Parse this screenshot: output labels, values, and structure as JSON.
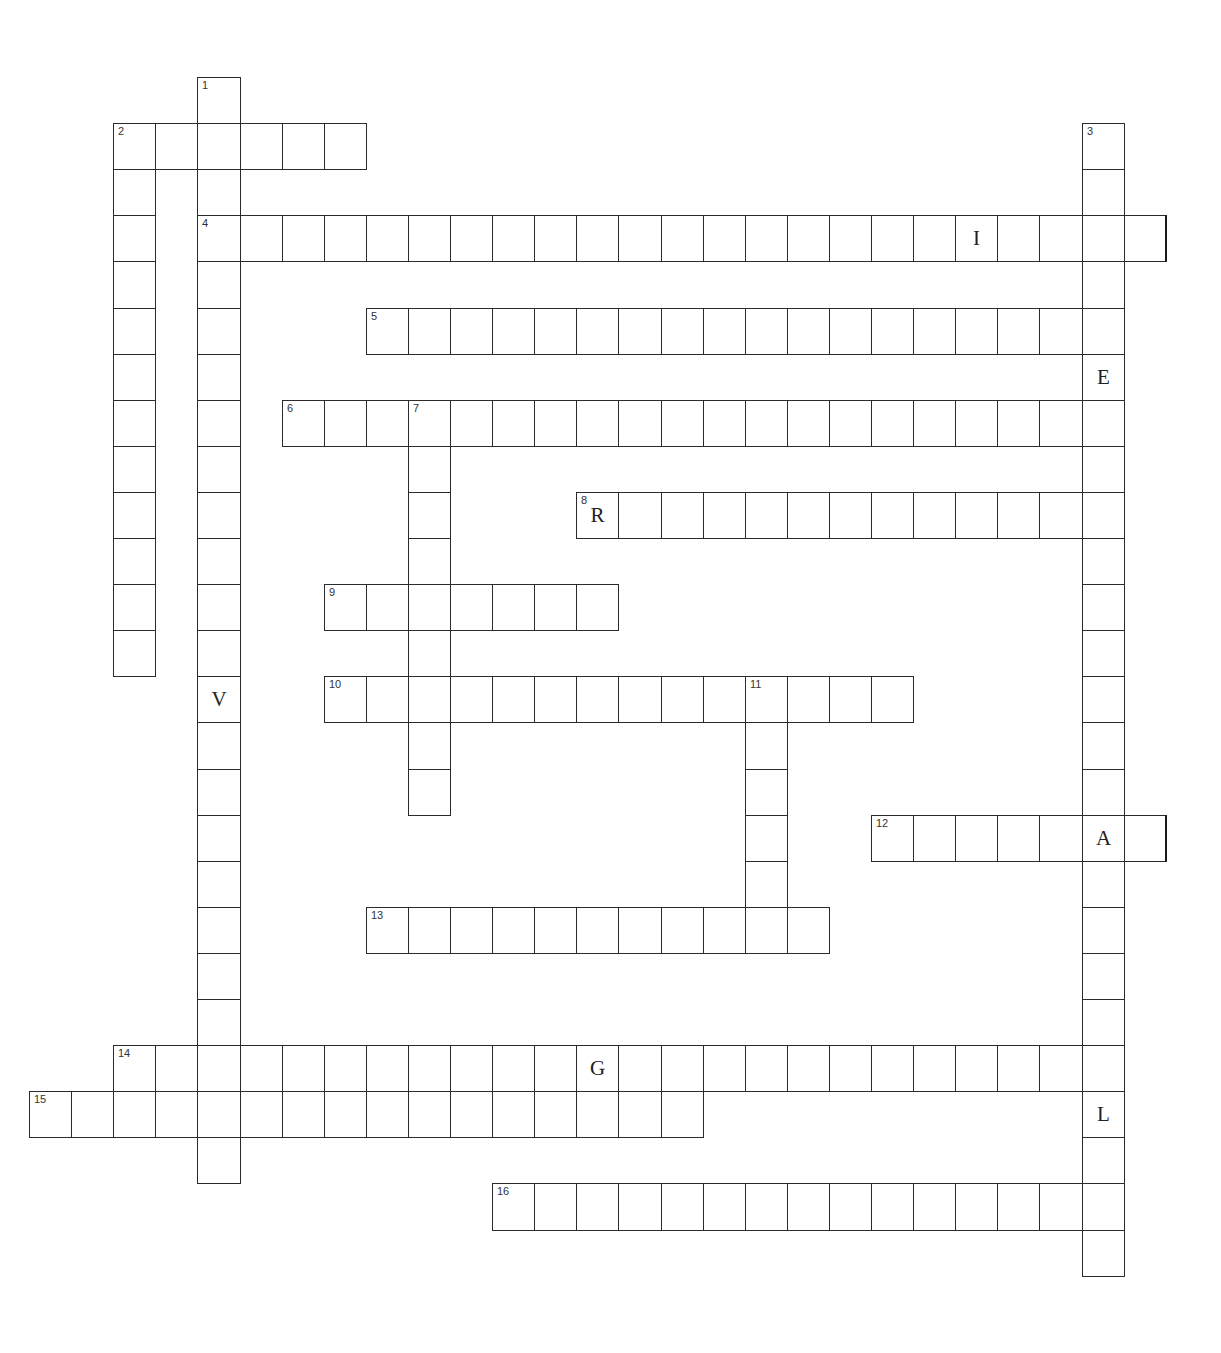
{
  "puzzle": {
    "grid": {
      "origin_x": 29,
      "origin_y": 77,
      "cell_w": 42.1,
      "cell_h": 46.1,
      "thick_right_col": 26,
      "line_color": "#2b2b2b"
    },
    "entries": [
      {
        "number": "1",
        "direction": "down",
        "row": 0,
        "col": 4,
        "length": 24,
        "given": [
          {
            "offset": 13,
            "letter": "V"
          }
        ]
      },
      {
        "number": "2",
        "direction": "across",
        "row": 1,
        "col": 2,
        "length": 6,
        "given": []
      },
      {
        "number": "2",
        "direction": "down",
        "row": 1,
        "col": 2,
        "length": 12,
        "given": []
      },
      {
        "number": "3",
        "direction": "down",
        "row": 1,
        "col": 25,
        "length": 25,
        "given": [
          {
            "offset": 5,
            "letter": "E"
          },
          {
            "offset": 21,
            "letter": "L"
          }
        ]
      },
      {
        "number": "4",
        "direction": "across",
        "row": 3,
        "col": 4,
        "length": 23,
        "given": [
          {
            "offset": 18,
            "letter": "I"
          }
        ]
      },
      {
        "number": "5",
        "direction": "across",
        "row": 5,
        "col": 8,
        "length": 18,
        "given": []
      },
      {
        "number": "6",
        "direction": "across",
        "row": 7,
        "col": 6,
        "length": 20,
        "given": []
      },
      {
        "number": "7",
        "direction": "down",
        "row": 7,
        "col": 9,
        "length": 9,
        "given": []
      },
      {
        "number": "8",
        "direction": "across",
        "row": 9,
        "col": 13,
        "length": 13,
        "given": [
          {
            "offset": 0,
            "letter": "R"
          }
        ]
      },
      {
        "number": "9",
        "direction": "across",
        "row": 11,
        "col": 7,
        "length": 7,
        "given": []
      },
      {
        "number": "10",
        "direction": "across",
        "row": 13,
        "col": 7,
        "length": 14,
        "given": []
      },
      {
        "number": "11",
        "direction": "down",
        "row": 13,
        "col": 17,
        "length": 5,
        "given": []
      },
      {
        "number": "12",
        "direction": "across",
        "row": 16,
        "col": 20,
        "length": 7,
        "given": [
          {
            "offset": 5,
            "letter": "A"
          }
        ]
      },
      {
        "number": "13",
        "direction": "across",
        "row": 18,
        "col": 8,
        "length": 11,
        "given": []
      },
      {
        "number": "14",
        "direction": "across",
        "row": 21,
        "col": 2,
        "length": 23,
        "given": [
          {
            "offset": 11,
            "letter": "G"
          }
        ]
      },
      {
        "number": "15",
        "direction": "across",
        "row": 22,
        "col": 0,
        "length": 16,
        "given": []
      },
      {
        "number": "16",
        "direction": "across",
        "row": 24,
        "col": 11,
        "length": 15,
        "given": []
      }
    ]
  }
}
